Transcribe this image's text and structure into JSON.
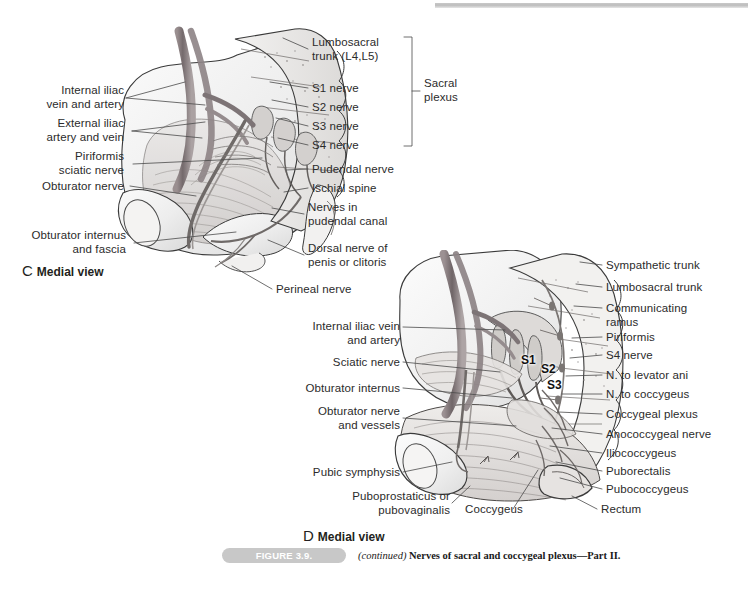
{
  "figure": {
    "number_pill": "FIGURE 3.9.",
    "continued": "(continued)",
    "caption": "Nerves of sacral and coccygeal plexus—Part II.",
    "pill_color": "#c8c8c8",
    "ink_color": "#2b2b2b"
  },
  "panels": [
    {
      "id": "C",
      "letter": "C",
      "view": "Medial view",
      "group_bracket_label": "Sacral\nplexus",
      "labels_left": [
        {
          "name": "internal-iliac-vein-and-artery",
          "text": "Internal iliac\nvein and artery"
        },
        {
          "name": "external-iliac-artery-and-vein",
          "text": "External iliac\nartery and vein"
        },
        {
          "name": "piriformis-sciatic-nerve",
          "text": "Piriformis\nsciatic nerve"
        },
        {
          "name": "obturator-nerve",
          "text": "Obturator nerve"
        },
        {
          "name": "obturator-internus-and-fascia",
          "text": "Obturator internus\nand fascia"
        }
      ],
      "labels_right": [
        {
          "name": "lumbosacral-trunk",
          "text": "Lumbosacral\ntrunk (L4,L5)"
        },
        {
          "name": "s1-nerve",
          "text": "S1 nerve"
        },
        {
          "name": "s2-nerve",
          "text": "S2 nerve"
        },
        {
          "name": "s3-nerve",
          "text": "S3 nerve"
        },
        {
          "name": "s4-nerve",
          "text": "S4 nerve"
        },
        {
          "name": "pudendal-nerve",
          "text": "Pudendal nerve"
        },
        {
          "name": "ischial-spine",
          "text": "Ischial spine"
        },
        {
          "name": "nerves-in-pudendal-canal",
          "text": "Nerves in\npudendal canal"
        },
        {
          "name": "dorsal-nerve-of-penis-or-clitoris",
          "text": "Dorsal nerve of\npenis or clitoris"
        },
        {
          "name": "perineal-nerve",
          "text": "Perineal nerve"
        }
      ]
    },
    {
      "id": "D",
      "letter": "D",
      "view": "Medial view",
      "root_labels": [
        "S1",
        "S2",
        "S3"
      ],
      "labels_left": [
        {
          "name": "internal-iliac-vein-and-artery",
          "text": "Internal iliac vein\nand artery"
        },
        {
          "name": "sciatic-nerve",
          "text": "Sciatic nerve"
        },
        {
          "name": "obturator-internus",
          "text": "Obturator internus"
        },
        {
          "name": "obturator-nerve-and-vessels",
          "text": "Obturator nerve\nand vessels"
        },
        {
          "name": "pubic-symphysis",
          "text": "Pubic symphysis"
        },
        {
          "name": "puboprostaticus-or-pubovaginalis",
          "text": "Puboprostaticus or\npubovaginalis"
        },
        {
          "name": "coccygeus",
          "text": "Coccygeus"
        }
      ],
      "labels_right": [
        {
          "name": "sympathetic-trunk",
          "text": "Sympathetic trunk"
        },
        {
          "name": "lumbosacral-trunk",
          "text": "Lumbosacral trunk"
        },
        {
          "name": "communicating-ramus",
          "text": "Communicating\nramus"
        },
        {
          "name": "piriformis",
          "text": "Piriformis"
        },
        {
          "name": "s4-nerve",
          "text": "S4 nerve"
        },
        {
          "name": "n-to-levator-ani",
          "text": "N. to levator ani"
        },
        {
          "name": "n-to-coccygeus",
          "text": "N. to coccygeus"
        },
        {
          "name": "coccygeal-plexus",
          "text": "Coccygeal plexus"
        },
        {
          "name": "anococcygeal-nerve",
          "text": "Anococcygeal nerve"
        },
        {
          "name": "iliococcygeus",
          "text": "Iliococcygeus"
        },
        {
          "name": "puborectalis",
          "text": "Puborectalis"
        },
        {
          "name": "pubococcygeus",
          "text": "Pubococcygeus"
        },
        {
          "name": "rectum",
          "text": "Rectum"
        }
      ]
    }
  ]
}
